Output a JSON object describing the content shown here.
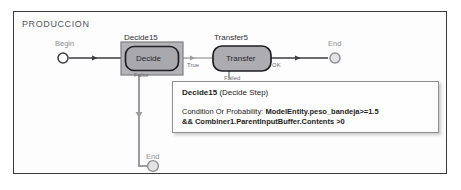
{
  "panel": {
    "title": "PRODUCCION"
  },
  "nodes": [
    {
      "id": "begin",
      "label": "Begin",
      "type": "start-endpoint"
    },
    {
      "id": "decide15",
      "name": "Decide15",
      "text": "Decide",
      "type": "decide-step",
      "selected": true
    },
    {
      "id": "transfer5",
      "name": "Transfer5",
      "text": "Transfer",
      "type": "transfer-step",
      "selected": false
    },
    {
      "id": "end_right",
      "label": "End",
      "type": "end-endpoint"
    },
    {
      "id": "end_bottom",
      "label": "End",
      "type": "end-endpoint"
    }
  ],
  "edges": [
    {
      "id": "begin-to-decide",
      "label": ""
    },
    {
      "id": "decide-true",
      "label": "True"
    },
    {
      "id": "decide-false",
      "label": "False"
    },
    {
      "id": "transfer-ok",
      "label": "OK"
    },
    {
      "id": "transfer-failed",
      "label": "Failed"
    }
  ],
  "tooltip": {
    "title": "Decide15",
    "subtitle": "(Decide Step)",
    "property_label": "Condition Or Probability:",
    "expression_line1": "ModelEntity.peso_bandeja>=1.5",
    "expression_line2": "&& Combiner1.ParentInputBuffer.Contents >0"
  },
  "colors": {
    "panel_border": "#3a3a3a",
    "node_fill": "#a9a9ad",
    "node_border": "#1f1f23",
    "selection_box": "#8f8f94",
    "connector": "#4a4a4f",
    "tooltip_border": "#8e8e93"
  }
}
